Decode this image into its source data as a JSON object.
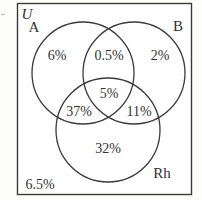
{
  "figure": {
    "type": "venn-diagram",
    "universal_set_label": "U",
    "background_color": "#fdfdfb",
    "ink_color": "#333131",
    "border_color": "#3a3a3a"
  },
  "sets": [
    {
      "key": "A",
      "label": "A",
      "cx": 83,
      "cy": 73,
      "r": 51
    },
    {
      "key": "B",
      "label": "B",
      "cx": 134,
      "cy": 73,
      "r": 51
    },
    {
      "key": "Rh",
      "label": "Rh",
      "cx": 108,
      "cy": 130,
      "r": 52
    }
  ],
  "regions": [
    {
      "key": "a_only",
      "label": "6%",
      "x": 57,
      "y": 56
    },
    {
      "key": "a_and_b",
      "label": "0.5%",
      "x": 109,
      "y": 56
    },
    {
      "key": "b_only",
      "label": "2%",
      "x": 160,
      "y": 56
    },
    {
      "key": "a_b_rh",
      "label": "5%",
      "x": 109,
      "y": 94
    },
    {
      "key": "a_and_rh",
      "label": "37%",
      "x": 79,
      "y": 112
    },
    {
      "key": "b_and_rh",
      "label": "11%",
      "x": 139,
      "y": 112
    },
    {
      "key": "rh_only",
      "label": "32%",
      "x": 108,
      "y": 149
    },
    {
      "key": "outside_all",
      "label": "6.5%",
      "x": 40,
      "y": 185
    }
  ],
  "set_labels": [
    {
      "key": "label-A",
      "label": "A",
      "x": 34,
      "y": 27
    },
    {
      "key": "label-B",
      "label": "B",
      "x": 178,
      "y": 26
    },
    {
      "key": "label-Rh",
      "label": "Rh",
      "x": 162,
      "y": 173
    },
    {
      "key": "label-U",
      "label": "U",
      "x": 27,
      "y": 14
    }
  ],
  "chart_data": {
    "type": "venn",
    "title": "",
    "sets": [
      "A",
      "B",
      "Rh"
    ],
    "universal_set": "U",
    "unit": "percent",
    "values": {
      "A only": 6,
      "A and B only": 0.5,
      "B only": 2,
      "A and B and Rh": 5,
      "A and Rh only": 37,
      "B and Rh only": 11,
      "Rh only": 32,
      "outside all sets": 6.5
    },
    "labels": [
      "6%",
      "0.5%",
      "2%",
      "5%",
      "37%",
      "11%",
      "32%",
      "6.5%"
    ],
    "total": 100
  }
}
